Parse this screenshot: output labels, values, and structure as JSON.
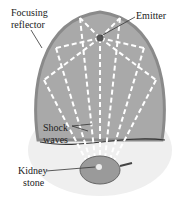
{
  "labels": {
    "focusing_reflector_line1": "Focusing",
    "focusing_reflector_line2": "reflector",
    "emitter": "Emitter",
    "shock_waves_line1": "Shock",
    "shock_waves_line2": "waves",
    "kidney_stone_line1": "Kidney",
    "kidney_stone_line2": "stone"
  },
  "colors": {
    "reflector_fill": "#a6a6a6",
    "reflector_rim": "#8a8a8a",
    "body_fill": "#f0f0f0",
    "wave_lines": "#ffffff"
  }
}
